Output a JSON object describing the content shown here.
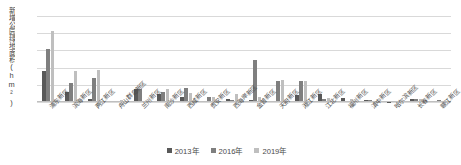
{
  "chart_data": {
    "type": "bar",
    "title": "",
    "xlabel": "",
    "ylabel": "新增公园绿地面积(hm²)",
    "ylim": [
      0,
      1000
    ],
    "yticks": [
      0,
      200,
      400,
      600,
      800,
      1000
    ],
    "grid": true,
    "legend_position": "bottom",
    "categories": [
      "浦东新区",
      "滨海新区",
      "两江新区",
      "舟山群岛新区",
      "兰州新区",
      "南沙新区",
      "西咸新区",
      "贵安新区",
      "西海岸新区",
      "金普新区",
      "天府新区",
      "湘江新区",
      "江北新区",
      "福州新区",
      "滇中新区",
      "哈尔滨新区",
      "长春新区",
      "赣江新区"
    ],
    "series": [
      {
        "name": "2013年",
        "color": "#595959",
        "values": [
          360,
          120,
          30,
          0,
          150,
          90,
          55,
          10,
          40,
          22,
          15,
          85,
          95,
          48,
          20,
          5,
          30,
          12
        ]
      },
      {
        "name": "2016年",
        "color": "#7f7f7f",
        "values": [
          620,
          225,
          282,
          8,
          148,
          120,
          160,
          55,
          22,
          488,
          245,
          240,
          30,
          12,
          18,
          0,
          35,
          18
        ]
      },
      {
        "name": "2019年",
        "color": "#bfbfbf",
        "values": [
          830,
          358,
          375,
          20,
          0,
          152,
          110,
          62,
          95,
          60,
          258,
          250,
          52,
          35,
          10,
          0,
          32,
          15
        ]
      }
    ]
  },
  "legend": {
    "items": [
      {
        "label": "2013年"
      },
      {
        "label": "2016年"
      },
      {
        "label": "2019年"
      }
    ]
  }
}
